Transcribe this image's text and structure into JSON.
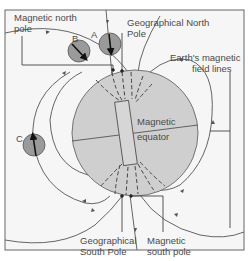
{
  "diagram": {
    "labels": {
      "magnetic_north_pole_line1": "Magnetic north",
      "magnetic_north_pole_line2": "pole",
      "geographical_north_pole_line1": "Geographical North",
      "geographical_north_pole_line2": "Pole",
      "field_lines_line1": "Earth's magnetic",
      "field_lines_line2": "field lines",
      "magnetic_equator_line1": "Magnetic",
      "magnetic_equator_line2": "equator",
      "geographical_south_pole_line1": "Geographical",
      "geographical_south_pole_line2": "South Pole",
      "magnetic_south_pole_line1": "Magnetic",
      "magnetic_south_pole_line2": "south pole",
      "compass_a": "A",
      "compass_b": "B",
      "compass_c": "C"
    },
    "colors": {
      "background": "#f6f6f6",
      "earth_fill": "#cfcfcf",
      "compass_fill": "#9a9a9a",
      "line": "#555555",
      "frame": "#666666"
    }
  }
}
